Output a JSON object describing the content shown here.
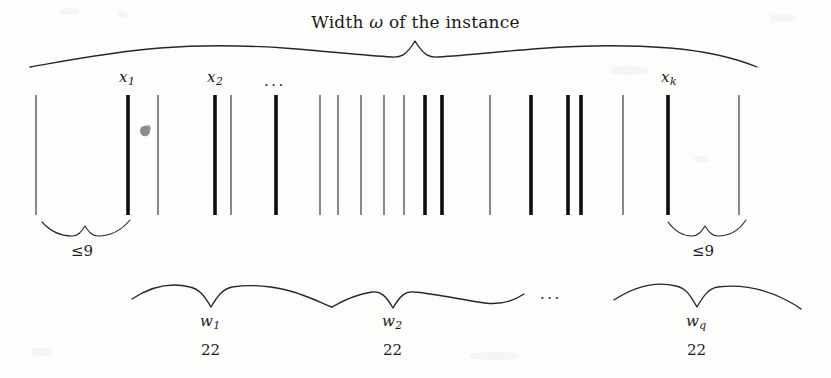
{
  "figure": {
    "title": "Width ω of the instance",
    "title_prefix": "Width ",
    "title_symbol": "ω",
    "title_suffix": " of the instance",
    "background_color": "#fdfdfc",
    "ink_color": "#1b1b1b",
    "thick_bar_color": "#0d0d0d",
    "thin_bar_color": "#3a3a3a",
    "width_px": 831,
    "height_px": 378
  },
  "item_labels": [
    {
      "name": "x-1",
      "base": "x",
      "subscript": "1",
      "x": 126,
      "y": 70
    },
    {
      "name": "x-2",
      "base": "x",
      "subscript": "2",
      "x": 214,
      "y": 70
    },
    {
      "name": "x-k",
      "base": "x",
      "subscript": "k",
      "x": 669,
      "y": 70
    }
  ],
  "ellipses": [
    {
      "name": "items-ellipsis",
      "text": "...",
      "x": 267,
      "y": 72
    },
    {
      "name": "groups-ellipsis",
      "text": "...",
      "x": 545,
      "y": 285
    }
  ],
  "gap_braces": [
    {
      "name": "left-gap-brace",
      "label": "≤9",
      "x1": 42,
      "x2": 128,
      "label_x": 72,
      "label_y": 246
    },
    {
      "name": "right-gap-brace",
      "label": "≤9",
      "x1": 668,
      "x2": 744,
      "label_x": 690,
      "label_y": 246
    }
  ],
  "group_braces": [
    {
      "name": "group-brace-w1",
      "symbol": "w",
      "subscript": "1",
      "value": "22",
      "x1": 132,
      "x2": 330,
      "label_x": 211,
      "label_y": 321,
      "value_x": 207,
      "value_y": 350
    },
    {
      "name": "group-brace-w2",
      "symbol": "w",
      "subscript": "2",
      "value": "22",
      "x1": 330,
      "x2": 520,
      "label_x": 393,
      "label_y": 321,
      "value_x": 389,
      "value_y": 350
    },
    {
      "name": "group-brace-wq",
      "symbol": "w",
      "subscript": "q",
      "value": "22",
      "x1": 610,
      "x2": 800,
      "label_x": 696,
      "label_y": 321,
      "value_x": 693,
      "value_y": 350
    }
  ],
  "bars": [
    {
      "x": 36,
      "thick": false
    },
    {
      "x": 128,
      "thick": true
    },
    {
      "x": 158,
      "thick": false
    },
    {
      "x": 215,
      "thick": true
    },
    {
      "x": 231,
      "thick": false
    },
    {
      "x": 276,
      "thick": true
    },
    {
      "x": 320,
      "thick": false
    },
    {
      "x": 338,
      "thick": false
    },
    {
      "x": 361,
      "thick": false
    },
    {
      "x": 384,
      "thick": false
    },
    {
      "x": 404,
      "thick": false
    },
    {
      "x": 425,
      "thick": true
    },
    {
      "x": 442,
      "thick": true
    },
    {
      "x": 490,
      "thick": false
    },
    {
      "x": 531,
      "thick": true
    },
    {
      "x": 568,
      "thick": true
    },
    {
      "x": 581,
      "thick": true
    },
    {
      "x": 623,
      "thick": false
    },
    {
      "x": 668,
      "thick": true
    },
    {
      "x": 739,
      "thick": false
    }
  ],
  "bar_extent": {
    "top": 95,
    "bottom": 215
  },
  "top_brace": {
    "name": "width-brace",
    "x1": 30,
    "x2": 757,
    "peak_x": 415,
    "baseline_y": 61,
    "peak_y": 41
  },
  "speck": {
    "x": 145,
    "y": 131,
    "r": 5
  }
}
